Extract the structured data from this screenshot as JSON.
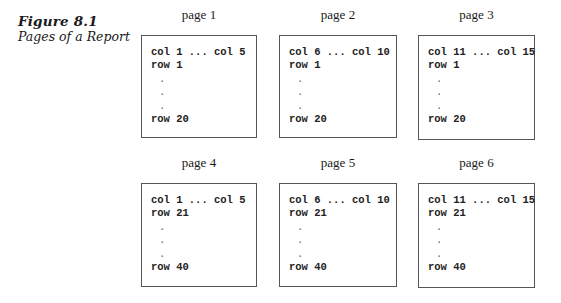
{
  "figure": {
    "number": "Figure 8.1",
    "title": "Pages of a Report"
  },
  "pages": [
    {
      "label": "page 1",
      "header": "col 1 ... col 5",
      "first_row": "row 1",
      "last_row": "row 20",
      "dots": [
        ".",
        ".",
        "."
      ]
    },
    {
      "label": "page 2",
      "header": "col 6 ... col 10",
      "first_row": "row 1",
      "last_row": "row 20",
      "dots": [
        ".",
        ".",
        "."
      ]
    },
    {
      "label": "page 3",
      "header": "col 11 ... col 15",
      "first_row": "row 1",
      "last_row": "row 20",
      "dots": [
        ".",
        ".",
        "."
      ]
    },
    {
      "label": "page 4",
      "header": "col 1 ... col 5",
      "first_row": "row 21",
      "last_row": "row 40",
      "dots": [
        ".",
        ".",
        "."
      ]
    },
    {
      "label": "page 5",
      "header": "col 6 ... col 10",
      "first_row": "row 21",
      "last_row": "row 40",
      "dots": [
        ".",
        ".",
        "."
      ]
    },
    {
      "label": "page 6",
      "header": "col 11 ... col 15",
      "first_row": "row 21",
      "last_row": "row 40",
      "dots": [
        ".",
        ".",
        "."
      ]
    }
  ]
}
